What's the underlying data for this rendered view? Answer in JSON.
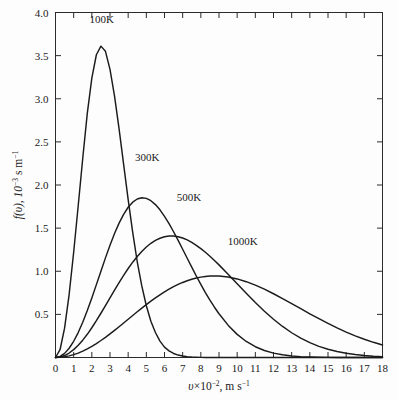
{
  "figure": {
    "title": "",
    "background_color": "#fdfdfd",
    "frame_color": "#2b2b2b",
    "curve_color": "#1b1b1b"
  },
  "axes": {
    "x_title_parts": {
      "symbol": "υ",
      "times": "×",
      "base": "10",
      "exponent": "−2",
      "comma_units": ", m s",
      "unit_exponent": "−1"
    },
    "y_title_parts": {
      "fn": "f(υ), 10",
      "exponent": "−3",
      "units": " s m",
      "unit_exponent": "−1"
    },
    "x_title_full": "υ×10−2, m s−1",
    "y_title_full": "f(υ), 10−3 s m−1",
    "x_ticks": [
      "0",
      "1",
      "2",
      "3",
      "4",
      "5",
      "6",
      "7",
      "8",
      "9",
      "10",
      "11",
      "12",
      "13",
      "14",
      "15",
      "16",
      "17",
      "18"
    ],
    "y_ticks": [
      "0.5",
      "1.0",
      "1.5",
      "2.0",
      "2.5",
      "3.0",
      "3.5",
      "4.0"
    ],
    "x_range": [
      0,
      18
    ],
    "y_range": [
      0,
      4.0
    ],
    "x_tick_step": 1,
    "y_tick_step": 0.5,
    "grid": false,
    "ticks_all_sides": true
  },
  "curve_labels": [
    {
      "text": "100K",
      "x_data": 2.55,
      "y_data": 3.88
    },
    {
      "text": "300K",
      "x_data": 5.05,
      "y_data": 2.28
    },
    {
      "text": "500K",
      "x_data": 7.35,
      "y_data": 1.82
    },
    {
      "text": "1000K",
      "x_data": 10.3,
      "y_data": 1.3
    }
  ],
  "chart_data": {
    "type": "line",
    "title": "",
    "subtitle": "",
    "xlabel": "υ×10−2, m s−1",
    "ylabel": "f(υ), 10−3 s m−1",
    "xlim": [
      0,
      18
    ],
    "ylim": [
      0,
      4.0
    ],
    "grid": false,
    "legend_position": "inline-annotations",
    "legend_entries": [
      "100K",
      "300K",
      "500K",
      "1000K"
    ],
    "x": [
      0,
      0.25,
      0.5,
      0.75,
      1,
      1.25,
      1.5,
      1.75,
      2,
      2.25,
      2.5,
      2.75,
      3,
      3.25,
      3.5,
      3.75,
      4,
      4.25,
      4.5,
      4.75,
      5,
      5.25,
      5.5,
      5.75,
      6,
      6.25,
      6.5,
      6.75,
      7,
      7.25,
      7.5,
      7.75,
      8,
      8.25,
      8.5,
      8.75,
      9,
      9.5,
      10,
      10.5,
      11,
      11.5,
      12,
      12.5,
      13,
      13.5,
      14,
      14.5,
      15,
      15.5,
      16,
      16.5,
      17,
      17.5,
      18
    ],
    "series": [
      {
        "name": "100K",
        "peak": {
          "x": 2.3,
          "y": 3.61
        },
        "values": [
          0,
          0.09,
          0.34,
          0.73,
          1.22,
          1.76,
          2.31,
          2.83,
          3.24,
          3.51,
          3.61,
          3.55,
          3.34,
          3.03,
          2.65,
          2.24,
          1.83,
          1.45,
          1.11,
          0.83,
          0.6,
          0.42,
          0.29,
          0.19,
          0.12,
          0.077,
          0.047,
          0.028,
          0.017,
          0.0096,
          0.0054,
          0.003,
          0.0016,
          0.00087,
          0.00046,
          0.00024,
          0.00012,
          3e-05,
          1e-05,
          0,
          0,
          0,
          0,
          0,
          0,
          0,
          0,
          0,
          0,
          0,
          0,
          0,
          0,
          0,
          0
        ]
      },
      {
        "name": "300K",
        "peak": {
          "x": 4.75,
          "y": 2.04
        },
        "values": [
          0,
          0.012,
          0.048,
          0.107,
          0.188,
          0.289,
          0.409,
          0.544,
          0.691,
          0.845,
          1.001,
          1.155,
          1.302,
          1.438,
          1.558,
          1.66,
          1.742,
          1.801,
          1.838,
          1.852,
          1.845,
          1.818,
          1.773,
          1.712,
          1.637,
          1.552,
          1.458,
          1.358,
          1.255,
          1.151,
          1.047,
          0.945,
          0.847,
          0.753,
          0.665,
          0.583,
          0.507,
          0.375,
          0.268,
          0.186,
          0.125,
          0.081,
          0.051,
          0.031,
          0.018,
          0.01,
          0.0057,
          0.0031,
          0.0016,
          0.0008,
          0.0004,
          0.0002,
          0.0001,
          5e-05,
          2e-05
        ]
      },
      {
        "name": "500K",
        "peak": {
          "x": 5.9,
          "y": 1.63
        },
        "values": [
          0,
          0.006,
          0.023,
          0.052,
          0.091,
          0.141,
          0.201,
          0.269,
          0.345,
          0.427,
          0.513,
          0.602,
          0.692,
          0.782,
          0.869,
          0.953,
          1.032,
          1.105,
          1.171,
          1.23,
          1.281,
          1.324,
          1.358,
          1.383,
          1.4,
          1.408,
          1.408,
          1.4,
          1.385,
          1.363,
          1.335,
          1.301,
          1.263,
          1.22,
          1.174,
          1.125,
          1.074,
          0.966,
          0.855,
          0.744,
          0.637,
          0.537,
          0.444,
          0.36,
          0.287,
          0.224,
          0.172,
          0.129,
          0.095,
          0.069,
          0.049,
          0.034,
          0.023,
          0.015,
          0.01
        ]
      },
      {
        "name": "1000K",
        "peak": {
          "x": 8.0,
          "y": 1.14
        },
        "values": [
          0,
          0.002,
          0.008,
          0.019,
          0.033,
          0.051,
          0.074,
          0.1,
          0.129,
          0.162,
          0.197,
          0.234,
          0.274,
          0.315,
          0.357,
          0.4,
          0.443,
          0.487,
          0.53,
          0.572,
          0.613,
          0.653,
          0.691,
          0.727,
          0.761,
          0.792,
          0.821,
          0.847,
          0.87,
          0.89,
          0.907,
          0.921,
          0.932,
          0.939,
          0.944,
          0.945,
          0.944,
          0.933,
          0.911,
          0.879,
          0.839,
          0.792,
          0.739,
          0.683,
          0.625,
          0.566,
          0.507,
          0.45,
          0.395,
          0.343,
          0.295,
          0.251,
          0.211,
          0.176,
          0.145
        ]
      }
    ]
  }
}
